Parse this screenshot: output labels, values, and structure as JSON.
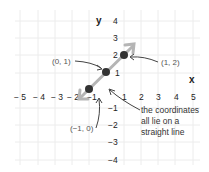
{
  "figure": {
    "axis_labels": {
      "x": "x",
      "y": "y"
    },
    "x_ticks": [
      "− 5",
      "− 4",
      "− 3",
      "− 2",
      "−1",
      "1",
      "2",
      "3",
      "4",
      "5"
    ],
    "y_ticks": [
      "4",
      "3",
      "2",
      "1",
      "−1",
      "−2",
      "−3",
      "−4"
    ],
    "points": [
      {
        "label": "(0, 1)",
        "x": 0,
        "y": 1
      },
      {
        "label": "(1, 2)",
        "x": 1,
        "y": 2
      },
      {
        "label": "(−1, 0)",
        "x": -1,
        "y": 0
      }
    ],
    "annotation": {
      "line1": "the coordinates",
      "line2": "all lie on a",
      "line3": "straight line"
    },
    "colors": {
      "grid": "#ececec",
      "line": "#b5b5b5",
      "point": "#333333",
      "text": "#222222",
      "label": "#555555"
    }
  }
}
